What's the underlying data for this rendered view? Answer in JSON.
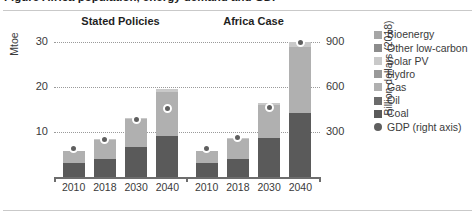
{
  "figure": {
    "title_clipped": "Figure   Africa population, energy demand and GDP",
    "left_axis_label": "Mtoe",
    "right_axis_label": "Billion dollars (2018)"
  },
  "chart_data": {
    "type": "bar",
    "title": "Africa population, energy demand and GDP",
    "xlabel": "",
    "ylabel": "Mtoe",
    "y2label": "Billion dollars (2018)",
    "ylim": [
      0,
      33
    ],
    "y2lim": [
      0,
      990
    ],
    "yticks": [
      10,
      20,
      30
    ],
    "y2ticks": [
      300,
      600,
      900
    ],
    "grid": true,
    "legend_position": "right",
    "stacked": true,
    "panels": [
      {
        "name": "Stated Policies",
        "categories": [
          "2010",
          "2018",
          "2030",
          "2040"
        ],
        "series": [
          {
            "name": "Coal",
            "values": [
              3.0,
              4.1,
              6.6,
              9.1
            ]
          },
          {
            "name": "Oil",
            "values": [
              0.0,
              0.0,
              0.0,
              0.0
            ]
          },
          {
            "name": "Gas",
            "values": [
              2.7,
              4.2,
              6.2,
              9.8
            ]
          },
          {
            "name": "Hydro",
            "values": [
              0.0,
              0.0,
              0.0,
              0.0
            ]
          },
          {
            "name": "Solar PV",
            "values": [
              0.0,
              0.2,
              0.3,
              0.6
            ]
          },
          {
            "name": "Other low-carbon",
            "values": [
              0.0,
              0.0,
              0.0,
              0.0
            ]
          },
          {
            "name": "Bioenergy",
            "values": [
              0.0,
              0.0,
              0.0,
              0.0
            ]
          }
        ],
        "gdp_right_axis": [
          190,
          250,
          380,
          455
        ]
      },
      {
        "name": "Africa Case",
        "categories": [
          "2010",
          "2018",
          "2030",
          "2040"
        ],
        "series": [
          {
            "name": "Coal",
            "values": [
              3.0,
              4.1,
              8.6,
              14.1
            ]
          },
          {
            "name": "Oil",
            "values": [
              0.0,
              0.0,
              0.0,
              0.0
            ]
          },
          {
            "name": "Gas",
            "values": [
              2.7,
              4.3,
              7.4,
              14.6
            ]
          },
          {
            "name": "Hydro",
            "values": [
              0.0,
              0.0,
              0.0,
              0.0
            ]
          },
          {
            "name": "Solar PV",
            "values": [
              0.0,
              0.2,
              0.5,
              1.3
            ]
          },
          {
            "name": "Other low-carbon",
            "values": [
              0.0,
              0.0,
              0.0,
              0.0
            ]
          },
          {
            "name": "Bioenergy",
            "values": [
              0.0,
              0.0,
              0.0,
              0.0
            ]
          }
        ],
        "gdp_right_axis": [
          190,
          265,
          460,
          895
        ]
      }
    ],
    "legend": [
      {
        "label": "Bioenergy",
        "color": "#a6a6a6",
        "marker": "square"
      },
      {
        "label": "Other low-carbon",
        "color": "#8c8c8c",
        "marker": "square"
      },
      {
        "label": "Solar PV",
        "color": "#c9c9c9",
        "marker": "square"
      },
      {
        "label": "Hydro",
        "color": "#999999",
        "marker": "square"
      },
      {
        "label": "Gas",
        "color": "#b0b0b0",
        "marker": "square"
      },
      {
        "label": "Oil",
        "color": "#6b6b6b",
        "marker": "square"
      },
      {
        "label": "Coal",
        "color": "#5a5a5a",
        "marker": "square"
      },
      {
        "label": "GDP (right axis)",
        "color": "#5f5f5f",
        "marker": "circle"
      }
    ]
  },
  "axes": {
    "left_ticks": [
      "30",
      "20",
      "10"
    ],
    "right_ticks": [
      "900",
      "600",
      "300"
    ]
  },
  "panels_meta": [
    {
      "title": "Stated Policies",
      "ticks": [
        "2010",
        "2018",
        "2030",
        "2040"
      ]
    },
    {
      "title": "Africa Case",
      "ticks": [
        "2010",
        "2018",
        "2030",
        "2040"
      ]
    }
  ]
}
